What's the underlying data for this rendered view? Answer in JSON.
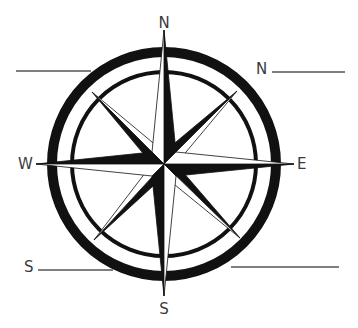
{
  "diagram": {
    "type": "compass-rose",
    "colors": {
      "ink": "#111111",
      "label": "#3a3a3a",
      "line": "#555555",
      "background": "#ffffff"
    },
    "cardinal_labels": {
      "north": "N",
      "south": "S",
      "east": "E",
      "west": "W"
    },
    "blank_fields": [
      {
        "position": "top-left",
        "prefix": ""
      },
      {
        "position": "top-right",
        "prefix": "N"
      },
      {
        "position": "bottom-left",
        "prefix": "S"
      },
      {
        "position": "bottom-right",
        "prefix": ""
      }
    ]
  }
}
